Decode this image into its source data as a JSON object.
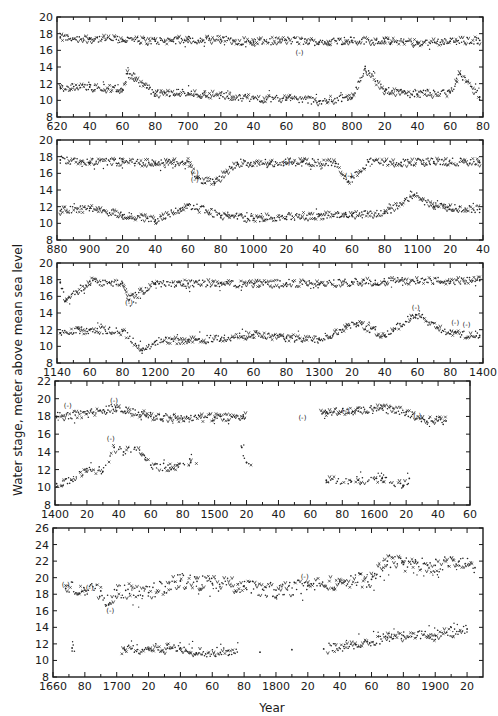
{
  "chart_data": {
    "type": "scatter",
    "title": "",
    "ylabel": "Water stage, meter above mean sea level",
    "xlabel": "Year",
    "grid": false,
    "legend": "none",
    "panels": [
      {
        "xlim": [
          620,
          880
        ],
        "ylim": [
          8,
          20
        ],
        "xticks": [
          620,
          640,
          660,
          680,
          700,
          720,
          740,
          760,
          780,
          800,
          820,
          840,
          860,
          880
        ],
        "xtick_labels": [
          "620",
          "40",
          "60",
          "80",
          "700",
          "20",
          "40",
          "60",
          "80",
          "800",
          "20",
          "40",
          "60",
          "80"
        ],
        "yticks": [
          8,
          10,
          12,
          14,
          16,
          18,
          20
        ],
        "series": [
          {
            "name": "maximum stage",
            "x": [
              622,
              640,
              660,
              680,
              700,
              720,
              740,
              760,
              780,
              800,
              820,
              840,
              860,
              878
            ],
            "y": [
              17.5,
              17.4,
              17.3,
              17.1,
              17.3,
              17.3,
              17.0,
              17.2,
              17.0,
              17.2,
              17.1,
              16.9,
              17.1,
              17.2
            ]
          },
          {
            "name": "minimum stage",
            "x": [
              622,
              640,
              660,
              663,
              680,
              700,
              720,
              740,
              760,
              780,
              800,
              808,
              820,
              840,
              860,
              866,
              878
            ],
            "y": [
              11.5,
              11.6,
              11.3,
              13.2,
              10.8,
              10.9,
              10.6,
              10.2,
              10.3,
              9.9,
              10.3,
              13.8,
              11.1,
              10.7,
              10.9,
              13.2,
              10.4
            ]
          }
        ],
        "annotations": [
          {
            "text": "(-)",
            "x": 768,
            "y": 15.5
          }
        ]
      },
      {
        "xlim": [
          880,
          1140
        ],
        "ylim": [
          8,
          20
        ],
        "xticks": [
          880,
          900,
          920,
          940,
          960,
          980,
          1000,
          1020,
          1040,
          1060,
          1080,
          1100,
          1120,
          1140
        ],
        "xtick_labels": [
          "880",
          "900",
          "20",
          "40",
          "60",
          "80",
          "1000",
          "20",
          "40",
          "60",
          "80",
          "1100",
          "20",
          "40"
        ],
        "yticks": [
          8,
          10,
          12,
          14,
          16,
          18,
          20
        ],
        "series": [
          {
            "name": "maximum stage",
            "x": [
              882,
              900,
              920,
              940,
              960,
              966,
              976,
              990,
              1010,
              1030,
              1050,
              1058,
              1070,
              1090,
              1110,
              1138
            ],
            "y": [
              17.6,
              17.3,
              17.4,
              17.2,
              17.4,
              15.4,
              14.8,
              17.3,
              17.2,
              17.4,
              17.2,
              15.0,
              17.4,
              17.3,
              17.4,
              17.3
            ]
          },
          {
            "name": "minimum stage",
            "x": [
              882,
              900,
              920,
              940,
              960,
              980,
              1000,
              1020,
              1040,
              1060,
              1080,
              1098,
              1110,
              1138
            ],
            "y": [
              11.5,
              11.8,
              11.0,
              10.4,
              12.2,
              10.9,
              10.6,
              10.8,
              10.9,
              11.0,
              11.2,
              13.4,
              12.0,
              11.7
            ]
          }
        ],
        "annotations": [
          {
            "text": "(-)",
            "x": 964,
            "y": 15.8
          },
          {
            "text": "(-)",
            "x": 964,
            "y": 15.0
          },
          {
            "text": "(-)",
            "x": 1020,
            "y": 17.0
          },
          {
            "text": "(-)",
            "x": 1058,
            "y": 15.5
          }
        ]
      },
      {
        "xlim": [
          1140,
          1400
        ],
        "ylim": [
          8,
          20
        ],
        "xticks": [
          1140,
          1160,
          1180,
          1200,
          1220,
          1240,
          1260,
          1280,
          1300,
          1320,
          1340,
          1360,
          1380,
          1400
        ],
        "xtick_labels": [
          "1140",
          "60",
          "80",
          "1200",
          "20",
          "40",
          "60",
          "80",
          "1300",
          "20",
          "40",
          "60",
          "80",
          "1400"
        ],
        "yticks": [
          8,
          10,
          12,
          14,
          16,
          18,
          20
        ],
        "series": [
          {
            "name": "maximum stage",
            "x": [
              1142,
              1145,
              1160,
              1180,
              1184,
              1200,
              1220,
              1240,
              1260,
              1280,
              1300,
              1320,
              1340,
              1360,
              1380,
              1398
            ],
            "y": [
              17.7,
              15.4,
              17.8,
              17.6,
              15.6,
              17.6,
              17.5,
              17.6,
              17.5,
              17.6,
              17.4,
              17.7,
              17.8,
              17.9,
              17.8,
              17.9
            ]
          },
          {
            "name": "minimum stage",
            "x": [
              1142,
              1160,
              1180,
              1192,
              1200,
              1220,
              1240,
              1260,
              1280,
              1300,
              1323,
              1340,
              1359,
              1380,
              1398
            ],
            "y": [
              11.6,
              12.0,
              11.8,
              9.5,
              10.6,
              10.8,
              10.9,
              11.4,
              11.0,
              10.8,
              12.8,
              11.3,
              13.8,
              11.5,
              11.3
            ]
          }
        ],
        "annotations": [
          {
            "text": "(-)",
            "x": 1184,
            "y": 15.0
          },
          {
            "text": "(-)",
            "x": 1359,
            "y": 14.4
          },
          {
            "text": "(-)",
            "x": 1383,
            "y": 12.6
          },
          {
            "text": "(-)",
            "x": 1390,
            "y": 12.3
          }
        ]
      },
      {
        "xlim": [
          1400,
          1660
        ],
        "ylim": [
          8,
          22
        ],
        "xticks": [
          1400,
          1420,
          1440,
          1460,
          1480,
          1500,
          1520,
          1540,
          1560,
          1580,
          1600,
          1620,
          1640,
          1660
        ],
        "xtick_labels": [
          "1400",
          "20",
          "40",
          "60",
          "80",
          "1500",
          "20",
          "40",
          "60",
          "80",
          "1600",
          "20",
          "40",
          "60"
        ],
        "yticks": [
          8,
          10,
          12,
          14,
          16,
          18,
          20,
          22
        ],
        "series": [
          {
            "name": "maximum stage",
            "x": [
              1401,
              1420,
              1438,
              1460,
              1480,
              1500,
              1518,
              1570,
              1590,
              1605,
              1620,
              1630,
              1645
            ],
            "y": [
              18.0,
              18.3,
              19.0,
              18.0,
              17.8,
              17.9,
              18.0,
              18.5,
              18.6,
              18.9,
              18.5,
              17.8,
              17.5
            ]
          },
          {
            "name": "minimum stage",
            "x": [
              1401,
              1410,
              1420,
              1430,
              1437,
              1443,
              1450,
              1460,
              1472,
              1485,
              1517,
              1520,
              1570,
              1590,
              1605,
              1618,
              1622
            ],
            "y": [
              10.4,
              10.8,
              12.1,
              11.8,
              14.5,
              14.0,
              14.5,
              12.5,
              12.2,
              12.8,
              14.5,
              12.8,
              10.8,
              10.8,
              11.0,
              10.2,
              11.0
            ]
          }
        ],
        "annotations": [
          {
            "text": "(-)",
            "x": 1408,
            "y": 19.0
          },
          {
            "text": "(-)",
            "x": 1437,
            "y": 19.5
          },
          {
            "text": "(-)",
            "x": 1435,
            "y": 15.2
          },
          {
            "text": "(-)",
            "x": 1555,
            "y": 17.6
          },
          {
            "text": "(-)",
            "x": 1582,
            "y": 18.4
          },
          {
            "text": "(-)",
            "x": 1627,
            "y": 17.8
          }
        ]
      },
      {
        "xlim": [
          1660,
          1930
        ],
        "ylim": [
          8,
          26
        ],
        "xticks": [
          1660,
          1680,
          1700,
          1720,
          1740,
          1760,
          1780,
          1800,
          1820,
          1840,
          1860,
          1880,
          1900,
          1920
        ],
        "xtick_labels": [
          "1660",
          "80",
          "1700",
          "20",
          "40",
          "60",
          "80",
          "1800",
          "20",
          "40",
          "60",
          "80",
          "1900",
          "20"
        ],
        "yticks": [
          8,
          10,
          12,
          14,
          16,
          18,
          20,
          22,
          24,
          26
        ],
        "series": [
          {
            "name": "maximum stage",
            "x": [
              1668,
              1680,
              1690,
              1695,
              1700,
              1720,
              1740,
              1760,
              1780,
              1800,
              1820,
              1840,
              1860,
              1870,
              1880,
              1900,
              1915,
              1925
            ],
            "y": [
              18.7,
              18.5,
              18.4,
              16.8,
              18.5,
              18.2,
              19.6,
              19.3,
              19.0,
              18.5,
              19.0,
              19.5,
              19.8,
              22.0,
              21.6,
              21.5,
              22.0,
              21.2
            ]
          },
          {
            "name": "minimum stage",
            "x": [
              1672,
              1705,
              1720,
              1740,
              1750,
              1770,
              1790,
              1810,
              1830,
              1850,
              1870,
              1880,
              1900,
              1920
            ],
            "y": [
              11.5,
              11.3,
              11.4,
              11.5,
              10.9,
              11.2,
              11.0,
              11.3,
              11.4,
              11.9,
              12.8,
              13.0,
              13.0,
              13.8
            ]
          }
        ],
        "annotations": [
          {
            "text": "(-)",
            "x": 1668,
            "y": 18.9
          },
          {
            "text": "(-)",
            "x": 1683,
            "y": 18.5
          },
          {
            "text": "(-)",
            "x": 1696,
            "y": 15.7
          },
          {
            "text": "(-)",
            "x": 1818,
            "y": 19.8
          }
        ]
      }
    ]
  }
}
